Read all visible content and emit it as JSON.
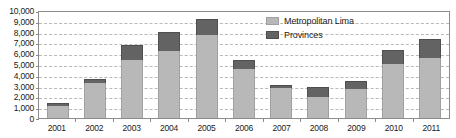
{
  "chart_data": {
    "type": "bar",
    "subtype": "stacked-vertical",
    "title": "",
    "xlabel": "",
    "ylabel": "",
    "ylim": [
      0,
      10000
    ],
    "ytick_values": [
      0,
      1000,
      2000,
      3000,
      4000,
      5000,
      6000,
      7000,
      8000,
      9000,
      10000
    ],
    "ytick_labels": [
      "0",
      "1,000",
      "2,000",
      "3,000",
      "4,000",
      "5,000",
      "6,000",
      "7,000",
      "8,000",
      "9,000",
      "10,000"
    ],
    "grid": true,
    "grid_style": "dashed-horizontal",
    "legend_position": "inside-top-right",
    "categories": [
      "2001",
      "2002",
      "2003",
      "2004",
      "2005",
      "2006",
      "2007",
      "2008",
      "2009",
      "2010",
      "2011"
    ],
    "series": [
      {
        "name": "Metropolitan Lima",
        "color": "#b8b8b8",
        "values": [
          1150,
          3200,
          5350,
          6200,
          7700,
          4500,
          2800,
          1950,
          2650,
          5000,
          5550
        ]
      },
      {
        "name": "Provinces",
        "color": "#636363",
        "values": [
          200,
          400,
          1400,
          1750,
          1450,
          900,
          250,
          950,
          800,
          1300,
          1800
        ]
      }
    ],
    "totals": [
      1350,
      3600,
      6750,
      7950,
      9150,
      5400,
      3050,
      2900,
      3450,
      6300,
      7350
    ]
  },
  "axes": {
    "y_axis_name": "y-axis",
    "x_axis_name": "x-axis"
  },
  "colors": {
    "metropolitan_lima": "#b8b8b8",
    "provinces": "#636363",
    "gridline": "#b9b9b9",
    "frame": "#8c8c8c",
    "text": "#1a1a1a",
    "background": "#ffffff"
  }
}
